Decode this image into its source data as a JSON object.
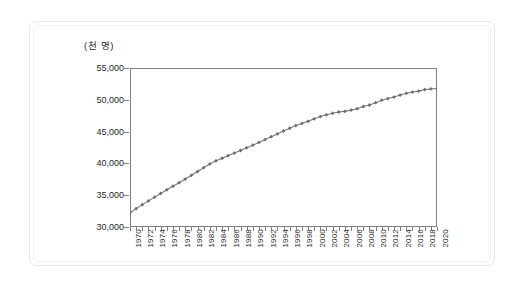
{
  "figure": {
    "unit_label": "(천 명)",
    "frame_color": "#808080",
    "line_color": "#7a7a7a",
    "marker_color": "#6e6e6e",
    "background": "#ffffff",
    "outer_border_color": "#e8e8e8"
  },
  "chart_data": {
    "type": "line",
    "title": "",
    "subtitle": "",
    "xlabel": "",
    "ylabel": "(천 명)",
    "ylim": [
      30000,
      55000
    ],
    "xlim": [
      1970,
      2020
    ],
    "ytick_labels": [
      "55,000",
      "50,000",
      "45,000",
      "40,000",
      "35,000",
      "30,000"
    ],
    "ytick_values": [
      55000,
      50000,
      45000,
      40000,
      35000,
      30000
    ],
    "ytick_step": 5000,
    "xtick_labels": [
      "1970",
      "1972",
      "1974",
      "1976",
      "1978",
      "1980",
      "1982",
      "1984",
      "1986",
      "1988",
      "1990",
      "1992",
      "1994",
      "1996",
      "1998",
      "2000",
      "2002",
      "2004",
      "2006",
      "2008",
      "2010",
      "2012",
      "2014",
      "2016",
      "2018",
      "2020"
    ],
    "xtick_label_rotation": 90,
    "xtick_interval_years": 1,
    "xlabel_interval_years": 2,
    "grid": false,
    "legend": null,
    "marker": "diamond",
    "x": [
      1970,
      1971,
      1972,
      1973,
      1974,
      1975,
      1976,
      1977,
      1978,
      1979,
      1980,
      1981,
      1982,
      1983,
      1984,
      1985,
      1986,
      1987,
      1988,
      1989,
      1990,
      1991,
      1992,
      1993,
      1994,
      1995,
      1996,
      1997,
      1998,
      1999,
      2000,
      2001,
      2002,
      2003,
      2004,
      2005,
      2006,
      2007,
      2008,
      2009,
      2010,
      2011,
      2012,
      2013,
      2014,
      2015,
      2016,
      2017,
      2018,
      2019,
      2020
    ],
    "values": [
      32241,
      32883,
      33505,
      34103,
      34692,
      35281,
      35849,
      36412,
      36969,
      37534,
      38124,
      38723,
      39326,
      39910,
      40406,
      40806,
      41214,
      41622,
      42031,
      42449,
      42869,
      43296,
      43748,
      44195,
      44642,
      45093,
      45525,
      45954,
      46287,
      46617,
      47008,
      47370,
      47645,
      47892,
      48083,
      48185,
      48372,
      48598,
      48949,
      49182,
      49554,
      49937,
      50200,
      50429,
      50747,
      51015,
      51218,
      51362,
      51607,
      51709,
      51781
    ],
    "series": [
      {
        "name": "총인구",
        "values": [
          32241,
          32883,
          33505,
          34103,
          34692,
          35281,
          35849,
          36412,
          36969,
          37534,
          38124,
          38723,
          39326,
          39910,
          40406,
          40806,
          41214,
          41622,
          42031,
          42449,
          42869,
          43296,
          43748,
          44195,
          44642,
          45093,
          45525,
          45954,
          46287,
          46617,
          47008,
          47370,
          47645,
          47892,
          48083,
          48185,
          48372,
          48598,
          48949,
          49182,
          49554,
          49937,
          50200,
          50429,
          50747,
          51015,
          51218,
          51362,
          51607,
          51709,
          51781
        ]
      }
    ]
  }
}
